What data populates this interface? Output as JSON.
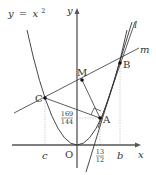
{
  "figure": {
    "curve_label": "y = x²",
    "curve_label_parts": {
      "lhs": "y",
      "eq": "=",
      "base": "x",
      "exp": "2"
    },
    "axes": {
      "x_label": "x",
      "y_label": "y",
      "origin_label": "O"
    },
    "lines": {
      "l_label": "l",
      "m_label": "m"
    },
    "points": {
      "A": "A",
      "B": "B",
      "C": "C",
      "M": "M"
    },
    "ticks": {
      "c": "c",
      "b": "b",
      "a_x_num": "13",
      "a_x_den": "12",
      "a_y_num": "169",
      "a_y_den": "144"
    },
    "colors": {
      "line": "#333333",
      "axis": "#555555",
      "dotted": "#aaaaaa"
    }
  }
}
